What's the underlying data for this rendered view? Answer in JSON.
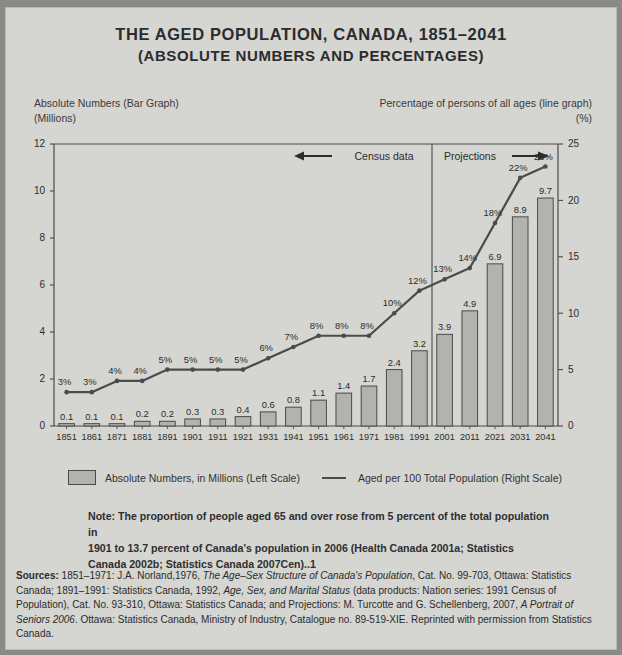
{
  "title": {
    "line1": "THE AGED POPULATION, CANADA, 1851–2041",
    "line2": "(ABSOLUTE NUMBERS AND PERCENTAGES)"
  },
  "captions": {
    "left_line1": "Absolute Numbers (Bar Graph)",
    "left_line2": "(Millions)",
    "right_line1": "Percentage of persons of all ages (line graph)",
    "right_line2": "(%)"
  },
  "annotations": {
    "census_label": "Census data",
    "projections_label": "Projections"
  },
  "legend": {
    "bars_label": "Absolute Numbers, in Millions (Left Scale)",
    "line_label": "Aged per 100 Total Population (Right Scale)"
  },
  "note": {
    "line1": "Note: The proportion of people aged 65 and over rose from 5 percent of the total population in",
    "line2": "1901 to 13.7 percent of Canada's population in 2006 (Health Canada 2001a; Statistics",
    "line3": "Canada 2002b; Statistics Canada 2007Cen)..1"
  },
  "sources": {
    "label": "Sources:",
    "seg1": " 1851–1971: J.A. Norland,1976, ",
    "ital1": "The Age–Sex Structure of Canada's Population",
    "seg2": ", Cat. No. 99-703, Ottawa: Statistics Canada; 1891–1991: Statistics Canada, 1992, ",
    "ital2": "Age, Sex, and Marital Status",
    "seg3": " (data products: Nation series: 1991 Census of Population), Cat. No. 93-310, Ottawa: Statistics Canada; and Projections: M. Turcotte and G. Schellenberg, 2007, ",
    "ital3": "A Portrait of Seniors 2006",
    "seg4": ". Ottawa: Statistics Canada, Ministry of Industry, Catalogue no. 89-519-XIE. Reprinted with permission from Statistics Canada."
  },
  "colors": {
    "page_background": "#d5d5d1",
    "outer_background": "#8a8a86",
    "bar_fill": "#b2b2ae",
    "bar_stroke": "#4a4a4a",
    "line_color": "#4b4b4b",
    "axis_color": "#4a4a4a",
    "text_color": "#2c2c2c"
  },
  "chart_data": {
    "type": "bar",
    "title": "The Aged Population, Canada, 1851–2041 (Absolute Numbers and Percentages)",
    "xlabel": "",
    "ylabel": "Absolute Numbers (Millions)",
    "y2label": "Percentage of persons of all ages (%)",
    "ylim": [
      0,
      12
    ],
    "y2lim": [
      0,
      25
    ],
    "yticks": [
      0,
      2,
      4,
      6,
      8,
      10,
      12
    ],
    "y2ticks": [
      0,
      5,
      10,
      15,
      20,
      25
    ],
    "grid": false,
    "legend_position": "below",
    "categories": [
      "1851",
      "1861",
      "1871",
      "1881",
      "1891",
      "1901",
      "1911",
      "1921",
      "1931",
      "1941",
      "1951",
      "1961",
      "1971",
      "1981",
      "1991",
      "2001",
      "2011",
      "2021",
      "2031",
      "2041"
    ],
    "series": [
      {
        "name": "Absolute Numbers, in Millions (Left Scale)",
        "type": "bar",
        "axis": "left",
        "values": [
          0.1,
          0.1,
          0.1,
          0.2,
          0.2,
          0.3,
          0.3,
          0.4,
          0.6,
          0.8,
          1.1,
          1.4,
          1.7,
          2.4,
          3.2,
          3.9,
          4.9,
          6.9,
          8.9,
          9.7
        ],
        "labels": [
          "0.1",
          "0.1",
          "0.1",
          "0.2",
          "0.2",
          "0.3",
          "0.3",
          "0.4",
          "0.6",
          "0.8",
          "1.1",
          "1.4",
          "1.7",
          "2.4",
          "3.2",
          "3.9",
          "4.9",
          "6.9",
          "8.9",
          "9.7"
        ]
      },
      {
        "name": "Aged per 100 Total Population (Right Scale)",
        "type": "line",
        "axis": "right",
        "values": [
          3,
          3,
          4,
          4,
          5,
          5,
          5,
          5,
          6,
          7,
          8,
          8,
          8,
          10,
          12,
          13,
          14,
          18,
          22,
          23
        ],
        "labels": [
          "3%",
          "3%",
          "4%",
          "4%",
          "5%",
          "5%",
          "5%",
          "5%",
          "6%",
          "7%",
          "8%",
          "8%",
          "8%",
          "10%",
          "12%",
          "13%",
          "14%",
          "18%",
          "22%",
          "23%"
        ]
      }
    ],
    "annotations": [
      {
        "text": "Census data",
        "note": "arrow pointing left, spans 1851-1991"
      },
      {
        "text": "Projections",
        "note": "arrow pointing right, spans 2001-2041"
      },
      {
        "text": "divider",
        "note": "vertical line between 1991 and 2001"
      }
    ]
  }
}
